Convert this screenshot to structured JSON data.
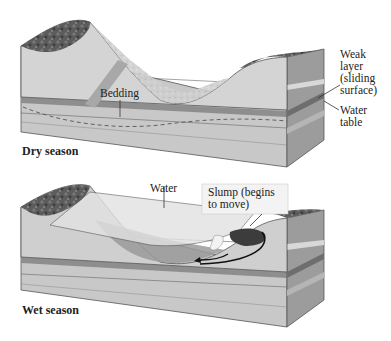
{
  "panels": [
    {
      "id": "dry",
      "caption": "Dry season",
      "labels": {
        "bedding": "Bedding",
        "weak_layer_1": "Weak",
        "weak_layer_2": "layer",
        "weak_layer_3": "(sliding",
        "weak_layer_4": "surface)",
        "water_table_1": "Water",
        "water_table_2": "table"
      }
    },
    {
      "id": "wet",
      "caption": "Wet season",
      "labels": {
        "water": "Water",
        "slump_1": "Slump (begins",
        "slump_2": "to move)"
      }
    }
  ],
  "colors": {
    "rock_top": "#5a5a5a",
    "front_face": "#c8c8c8",
    "side_face": "#9a9a9a",
    "weak_layer": "#8a8a8a",
    "slope": "#d6d6d6",
    "water": "#dcdcdc",
    "ink": "#222222"
  }
}
